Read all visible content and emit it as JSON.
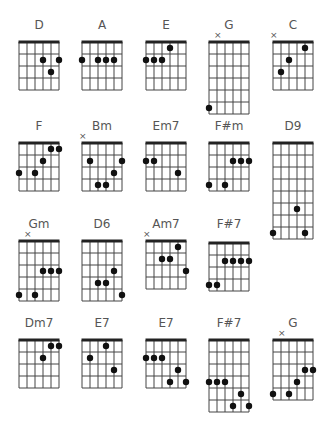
{
  "colors": {
    "line": "#444444",
    "nut": "#222222",
    "dot": "#111111",
    "label": "#555555"
  },
  "chords": [
    {
      "name": "D",
      "x": 19,
      "y": 42,
      "frets": 4,
      "label_y": 18,
      "mute": [],
      "dots": [
        [
          3,
          2
        ],
        [
          5,
          2
        ],
        [
          4,
          3
        ]
      ]
    },
    {
      "name": "A",
      "x": 82,
      "y": 42,
      "frets": 4,
      "label_y": 18,
      "mute": [],
      "dots": [
        [
          0,
          2
        ],
        [
          2,
          2
        ],
        [
          3,
          2
        ],
        [
          4,
          2
        ]
      ]
    },
    {
      "name": "E",
      "x": 146,
      "y": 42,
      "frets": 4,
      "label_y": 18,
      "mute": [],
      "dots": [
        [
          3,
          1
        ],
        [
          0,
          2
        ],
        [
          1,
          2
        ],
        [
          2,
          2
        ]
      ]
    },
    {
      "name": "G",
      "x": 209,
      "y": 42,
      "frets": 6,
      "label_y": 18,
      "mute": [
        1
      ],
      "dots": [
        [
          0,
          6
        ]
      ]
    },
    {
      "name": "C",
      "x": 273,
      "y": 42,
      "frets": 4,
      "label_y": 18,
      "mute": [
        0
      ],
      "dots": [
        [
          4,
          1
        ],
        [
          2,
          2
        ],
        [
          1,
          3
        ]
      ]
    },
    {
      "name": "F",
      "x": 19,
      "y": 143,
      "frets": 4,
      "label_y": 119,
      "mute": [],
      "dots": [
        [
          4,
          1
        ],
        [
          5,
          1
        ],
        [
          3,
          2
        ],
        [
          0,
          3
        ],
        [
          2,
          3
        ]
      ]
    },
    {
      "name": "Bm",
      "x": 82,
      "y": 143,
      "frets": 4,
      "label_y": 119,
      "mute": [
        0
      ],
      "dots": [
        [
          1,
          2
        ],
        [
          5,
          2
        ],
        [
          4,
          3
        ],
        [
          2,
          4
        ],
        [
          3,
          4
        ]
      ]
    },
    {
      "name": "Em7",
      "x": 146,
      "y": 143,
      "frets": 4,
      "label_y": 119,
      "mute": [],
      "dots": [
        [
          0,
          2
        ],
        [
          1,
          2
        ],
        [
          4,
          3
        ]
      ]
    },
    {
      "name": "F#m",
      "x": 209,
      "y": 143,
      "frets": 4,
      "label_y": 119,
      "mute": [],
      "dots": [
        [
          3,
          2
        ],
        [
          4,
          2
        ],
        [
          5,
          2
        ],
        [
          0,
          4
        ],
        [
          2,
          4
        ]
      ]
    },
    {
      "name": "D9",
      "x": 273,
      "y": 143,
      "frets": 8,
      "label_y": 119,
      "mute": [],
      "dots": [
        [
          3,
          6
        ],
        [
          0,
          8
        ],
        [
          4,
          8
        ]
      ]
    },
    {
      "name": "Gm",
      "x": 19,
      "y": 241,
      "frets": 5,
      "label_y": 217,
      "mute": [
        1
      ],
      "dots": [
        [
          3,
          3
        ],
        [
          4,
          3
        ],
        [
          5,
          3
        ],
        [
          0,
          5
        ],
        [
          2,
          5
        ]
      ]
    },
    {
      "name": "D6",
      "x": 82,
      "y": 241,
      "frets": 5,
      "label_y": 217,
      "mute": [],
      "dots": [
        [
          4,
          3
        ],
        [
          2,
          4
        ],
        [
          3,
          4
        ],
        [
          5,
          5
        ]
      ]
    },
    {
      "name": "Am7",
      "x": 146,
      "y": 241,
      "frets": 4,
      "label_y": 217,
      "mute": [
        0
      ],
      "dots": [
        [
          4,
          1
        ],
        [
          2,
          2
        ],
        [
          3,
          2
        ],
        [
          5,
          3
        ]
      ]
    },
    {
      "name": "F#7",
      "x": 209,
      "y": 243,
      "frets": 4,
      "label_y": 217,
      "mute": [],
      "dots": [
        [
          2,
          2
        ],
        [
          3,
          2
        ],
        [
          4,
          2
        ],
        [
          5,
          2
        ],
        [
          0,
          4
        ],
        [
          1,
          4
        ]
      ]
    },
    {
      "name": "Dm7",
      "x": 19,
      "y": 340,
      "frets": 4,
      "label_y": 316,
      "mute": [],
      "dots": [
        [
          4,
          1
        ],
        [
          5,
          1
        ],
        [
          3,
          2
        ]
      ]
    },
    {
      "name": "E7",
      "x": 82,
      "y": 340,
      "frets": 4,
      "label_y": 316,
      "mute": [],
      "dots": [
        [
          3,
          1
        ],
        [
          1,
          2
        ],
        [
          4,
          3
        ]
      ]
    },
    {
      "name": "E7",
      "x": 146,
      "y": 340,
      "frets": 4,
      "label_y": 316,
      "mute": [],
      "dots": [
        [
          0,
          2
        ],
        [
          1,
          2
        ],
        [
          2,
          2
        ],
        [
          4,
          3
        ],
        [
          3,
          4
        ],
        [
          5,
          4
        ]
      ]
    },
    {
      "name": "F#7",
      "x": 209,
      "y": 340,
      "frets": 6,
      "label_y": 316,
      "mute": [],
      "dots": [
        [
          0,
          4
        ],
        [
          1,
          4
        ],
        [
          2,
          4
        ],
        [
          4,
          5
        ],
        [
          3,
          6
        ],
        [
          5,
          6
        ]
      ]
    },
    {
      "name": "G",
      "x": 273,
      "y": 340,
      "frets": 5,
      "label_y": 316,
      "mute": [
        1
      ],
      "dots": [
        [
          4,
          3
        ],
        [
          5,
          3
        ],
        [
          3,
          4
        ],
        [
          0,
          5
        ],
        [
          2,
          5
        ]
      ]
    }
  ]
}
